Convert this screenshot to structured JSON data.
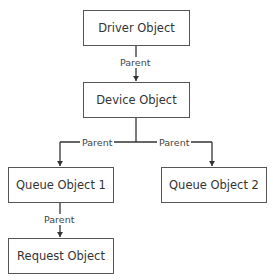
{
  "diagram": {
    "nodes": [
      {
        "id": "driver",
        "label": "Driver Object"
      },
      {
        "id": "device",
        "label": "Device Object"
      },
      {
        "id": "queue1",
        "label": "Queue Object 1"
      },
      {
        "id": "queue2",
        "label": "Queue Object 2"
      },
      {
        "id": "request",
        "label": "Request Object"
      }
    ],
    "edges": [
      {
        "from": "driver",
        "to": "device",
        "label": "Parent"
      },
      {
        "from": "device",
        "to": "queue1",
        "label": "Parent"
      },
      {
        "from": "device",
        "to": "queue2",
        "label": "Parent"
      },
      {
        "from": "queue1",
        "to": "request",
        "label": "Parent"
      }
    ],
    "line_color": "#333333"
  }
}
